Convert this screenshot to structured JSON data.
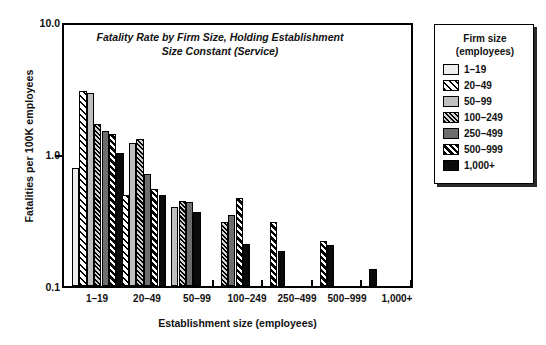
{
  "chart_data": {
    "type": "bar",
    "title": "Fatality Rate by Firm Size, Holding Establishment Size Constant (Service)",
    "title_line1": "Fatality Rate by Firm Size, Holding Establishment",
    "title_line2": "Size Constant (Service)",
    "xlabel": "Establishment size (employees)",
    "ylabel": "Fatalities per 100K employees",
    "yscale": "log",
    "ylim": [
      0.1,
      10.0
    ],
    "yticks": [
      0.1,
      1.0,
      10.0
    ],
    "ytick_labels": [
      "0.1",
      "1.0",
      "10.0"
    ],
    "grid": false,
    "legend_position": "right-outside",
    "legend_title_line1": "Firm size",
    "legend_title_line2": "(employees)",
    "categories": [
      "1–19",
      "20–49",
      "50–99",
      "100–249",
      "250–499",
      "500–999",
      "1,000+"
    ],
    "series": [
      {
        "name": "1–19",
        "pattern": "light-solid",
        "values": [
          0.8,
          null,
          null,
          null,
          null,
          null,
          null
        ]
      },
      {
        "name": "20–49",
        "pattern": "wide-diagonal",
        "values": [
          3.1,
          0.5,
          null,
          null,
          null,
          null,
          null
        ]
      },
      {
        "name": "50–99",
        "pattern": "light-gray-solid",
        "values": [
          3.0,
          1.25,
          0.4,
          null,
          null,
          null,
          null
        ]
      },
      {
        "name": "100–249",
        "pattern": "dense-diagonal",
        "values": [
          1.75,
          1.35,
          0.45,
          0.31,
          null,
          null,
          null
        ]
      },
      {
        "name": "250–499",
        "pattern": "dark-gray-solid",
        "values": [
          1.55,
          0.72,
          0.44,
          0.35,
          null,
          null,
          null
        ]
      },
      {
        "name": "500–999",
        "pattern": "bold-diagonal",
        "values": [
          1.45,
          0.55,
          null,
          0.47,
          0.31,
          0.22,
          null
        ]
      },
      {
        "name": "1,000+",
        "pattern": "black-solid",
        "values": [
          1.05,
          0.5,
          0.37,
          0.21,
          0.185,
          0.205,
          0.135
        ]
      }
    ]
  },
  "legend": {
    "title_line1": "Firm size",
    "title_line2": "(employees)",
    "items": [
      {
        "label": "1–19"
      },
      {
        "label": "20–49"
      },
      {
        "label": "50–99"
      },
      {
        "label": "100–249"
      },
      {
        "label": "250–499"
      },
      {
        "label": "500–999"
      },
      {
        "label": "1,000+"
      }
    ]
  },
  "axes": {
    "y_title": "Fatalities per 100K employees",
    "x_title": "Establishment size (employees)",
    "y_tick_top": "10.0",
    "y_tick_mid": "1.0",
    "y_tick_bottom": "0.1"
  },
  "colors": {
    "frame": "#000000",
    "background": "#ffffff",
    "text": "#111111",
    "series_light": "#eeeeec",
    "series_gray": "#bfbfbf",
    "series_dark_gray": "#6e6e6e",
    "series_black": "#0a0a0a"
  }
}
